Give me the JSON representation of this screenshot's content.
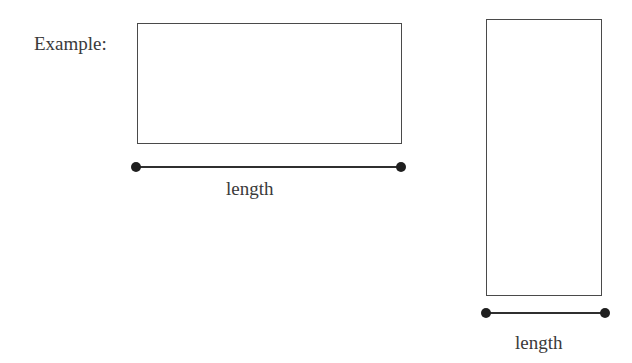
{
  "diagram": {
    "example_label": "Example:",
    "shapes": [
      {
        "name": "horizontal-rectangle",
        "measure_label": "length"
      },
      {
        "name": "vertical-rectangle",
        "measure_label": "length"
      }
    ],
    "colors": {
      "stroke": "#4a4a4a",
      "text": "#3a3a3a",
      "background": "#ffffff"
    }
  }
}
